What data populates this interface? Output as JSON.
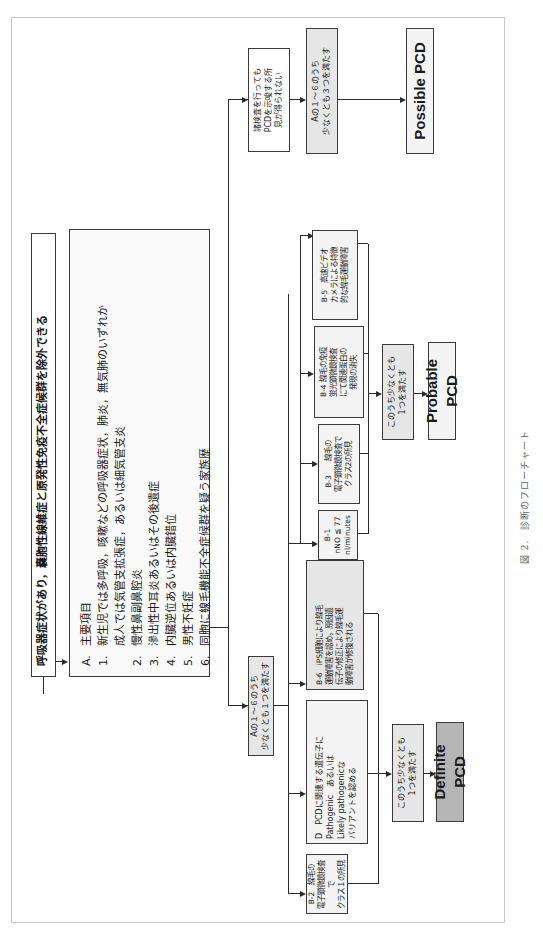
{
  "title": "呼吸器症状があり，嚢胞性線維症と原発性免疫不全症候群を除外できる",
  "criteria": {
    "header_num": "A.",
    "header": "主要項目",
    "items": [
      {
        "num": "1.",
        "text": "新生児では多呼吸，咳嗽などの呼吸器症状，肺炎，無気肺のいずれか",
        "sub": "成人では気管支拡張症，あるいは細気管支炎"
      },
      {
        "num": "2.",
        "text": "慢性鼻副鼻腔炎"
      },
      {
        "num": "3.",
        "text": "滲出性中耳炎あるいはその後遺症"
      },
      {
        "num": "4.",
        "text": "内臓逆位あるいは内臓錯位"
      },
      {
        "num": "5.",
        "text": "男性不妊症"
      },
      {
        "num": "6.",
        "text": "同胞に線毛機能不全症候群を疑う家族歴"
      }
    ]
  },
  "branch_a1": "Aの１～６のうち\n少なくとも１つを満たす",
  "branch_none": "諸検査を行っても\nPCDを示唆する所\n見が得られない",
  "branch_a3": "Aの１～６のうち\n少なくとも３つを満たす",
  "tests": {
    "b1": "B-1\nnNO ≦ 77\nnl/minutes",
    "b2": "B-2　線毛の\n電子顕微鏡検査で\nクラス１の所見",
    "b3": "B-3　　線毛の\n電子顕微鏡検査で\nクラス2の所見",
    "b4": "B-4 線毛の免疫\n蛍光顕微鏡検査\nにて関連蛋白の\n発現の消失",
    "b5": "B-5　高速ビデオ\nカメラによる特徴\n的な線毛運動障害",
    "b6": "B-6　iPS細胞により線毛\n運動障害を認め，原因遺\n伝子の修正により線毛運\n動障害が修復される",
    "d": "D　PCDに関連する遺伝子に\nPathogenic　あるいは\nLikely pathogenicな\nバリアントを認める"
  },
  "at_least_one_definite": "このうち少なくとも\n1つを満たす",
  "at_least_one_probable": "このうち少なくとも\n1つを満たす",
  "results": {
    "definite": "Definite PCD",
    "probable": "Probable PCD",
    "possible": "Possible PCD"
  },
  "caption": "図 2.　診断のフローチャート",
  "colors": {
    "line": "#2b2b2b",
    "grey_box": "#e6e6e6",
    "definite_box": "#b5b5b5",
    "frame": "#c8c8c8"
  }
}
